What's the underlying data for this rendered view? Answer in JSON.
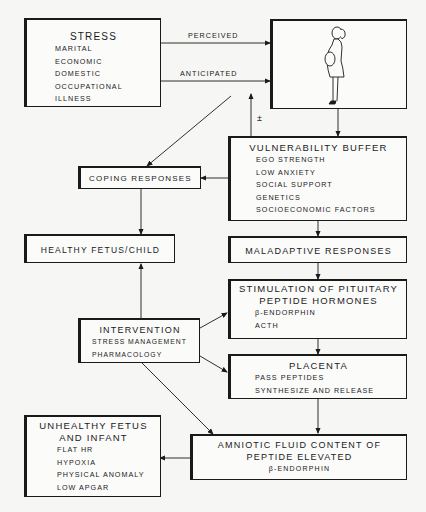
{
  "diagram": {
    "stress": {
      "title": "STRESS",
      "items": [
        "MARITAL",
        "ECONOMIC",
        "DOMESTIC",
        "OCCUPATIONAL",
        "ILLNESS"
      ]
    },
    "edges_labels": {
      "perceived": "PERCEIVED",
      "anticipated": "ANTICIPATED",
      "plus_minus": "±"
    },
    "pregnant_woman": {
      "icon": "pregnant-woman-illustration"
    },
    "vulnerability": {
      "title": "VULNERABILITY BUFFER",
      "items": [
        "EGO STRENGTH",
        "LOW ANXIETY",
        "SOCIAL SUPPORT",
        "GENETICS",
        "SOCIOECONOMIC FACTORS"
      ]
    },
    "coping": {
      "title": "COPING RESPONSES"
    },
    "healthy": {
      "title": "HEALTHY FETUS/CHILD"
    },
    "maladaptive": {
      "title": "MALADAPTIVE RESPONSES"
    },
    "pituitary": {
      "title1": "STIMULATION OF PITUITARY",
      "title2": "PEPTIDE HORMONES",
      "items": [
        "β-ENDORPHIN",
        "ACTH"
      ]
    },
    "intervention": {
      "title": "INTERVENTION",
      "items": [
        "STRESS MANAGEMENT",
        "PHARMACOLOGY"
      ]
    },
    "placenta": {
      "title": "PLACENTA",
      "items": [
        "PASS PEPTIDES",
        "SYNTHESIZE AND RELEASE"
      ]
    },
    "unhealthy": {
      "title1": "UNHEALTHY FETUS",
      "title2": "AND INFANT",
      "items": [
        "FLAT HR",
        "HYPOXIA",
        "PHYSICAL ANOMALY",
        "LOW APGAR"
      ]
    },
    "amniotic": {
      "title1": "AMNIOTIC FLUID CONTENT OF",
      "title2": "PEPTIDE ELEVATED",
      "items": [
        "β-ENDORPHIN"
      ]
    }
  }
}
